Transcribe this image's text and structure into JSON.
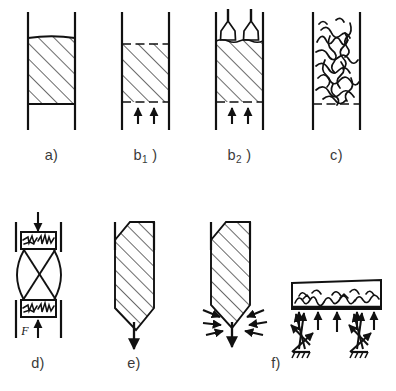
{
  "figure": {
    "background_color": "#ffffff",
    "ink_color": "#111111",
    "caption_color": "#3a3a3a"
  },
  "panels": [
    {
      "id": "a",
      "label": "a",
      "label_suffix": ")",
      "subscript": "",
      "description": "vertical column with settled hatched material, flat meniscus top",
      "features": [
        "column-walls",
        "hatched-bed",
        "solid-top-edge",
        "solid-bottom-edge"
      ]
    },
    {
      "id": "b1",
      "label": "b",
      "label_suffix": " )",
      "subscript": "1",
      "description": "vertical column with hatched bed bounded by dashed lines, two upward flow arrows below",
      "features": [
        "column-walls",
        "hatched-bed",
        "dashed-top-edge",
        "dashed-bottom-edge",
        "upward-arrows"
      ],
      "arrow_count": 2
    },
    {
      "id": "b2",
      "label": "b",
      "label_suffix": " )",
      "subscript": "2",
      "description": "vertical column with two spray nozzles above hatched bed and two upward flow arrows below",
      "features": [
        "column-walls",
        "spray-nozzles",
        "hatched-bed",
        "dashed-bottom-edge",
        "upward-arrows"
      ],
      "nozzle_count": 2,
      "arrow_count": 2
    },
    {
      "id": "c",
      "label": "c",
      "label_suffix": ")",
      "subscript": "",
      "description": "vertical column filled with chaotic turbulent scribble pattern, dashed bottom edge",
      "features": [
        "column-walls",
        "turbulent-scribble",
        "dashed-bottom-edge"
      ]
    },
    {
      "id": "d",
      "label": "d",
      "label_suffix": ")",
      "subscript": "",
      "description": "press with upper and lower filled platens, crossed hourglass linkage between them, downward load arrow on top and upward force arrow F below",
      "features": [
        "side-rails",
        "upper-platen",
        "lower-platen",
        "hourglass-linkage",
        "down-arrow",
        "up-arrow",
        "force-label"
      ],
      "force_label": "F"
    },
    {
      "id": "e",
      "label": "e",
      "label_suffix": ")",
      "subscript": "",
      "description": "hatched body with chamfered top and pointed bottom inside column walls, single downward discharge arrow",
      "features": [
        "column-walls",
        "hatched-body-pointed",
        "down-arrow"
      ]
    },
    {
      "id": "f",
      "label": "f",
      "label_suffix": ")",
      "subscript": "",
      "description": "left: hatched pointed body with converging side arrows and downward arrow; right: horizontal vessel with scribbled contents, upward arrows and two ground-support arrow clusters",
      "features": [
        "column-walls",
        "hatched-body-pointed",
        "converging-arrows",
        "down-arrow",
        "horizontal-vessel",
        "scribble-contents",
        "upward-arrows",
        "ground-supports"
      ],
      "upward_arrow_count": 5,
      "support_count": 2
    }
  ]
}
